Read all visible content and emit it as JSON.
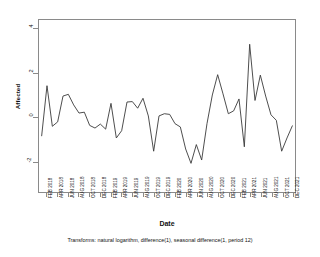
{
  "chart_data": {
    "type": "line",
    "title": "",
    "xlabel": "Date",
    "ylabel": "Affected",
    "ylim": [
      -3.4,
      4.4
    ],
    "yticks": [
      4,
      2,
      0,
      -2
    ],
    "ytick_labels": [
      "4",
      "2",
      "0",
      "-2"
    ],
    "grid": false,
    "legend": null,
    "footnote": "Transforms: natural logarithm, difference(1), seasonal difference(1, period 12)",
    "x": [
      "JAN 2018",
      "FEB 2018",
      "MAR 2018",
      "APR 2018",
      "MAY 2018",
      "JUN 2018",
      "JUL 2018",
      "AUG 2018",
      "SEP 2018",
      "OCT 2018",
      "NOV 2018",
      "DEC 2018",
      "JAN 2019",
      "FEB 2019",
      "MAR 2019",
      "APR 2019",
      "MAY 2019",
      "JUN 2019",
      "JUL 2019",
      "AUG 2019",
      "SEP 2019",
      "OCT 2019",
      "NOV 2019",
      "DEC 2019",
      "JAN 2020",
      "FEB 2020",
      "MAR 2020",
      "APR 2020",
      "MAY 2020",
      "JUN 2020",
      "JUL 2020",
      "AUG 2020",
      "SEP 2020",
      "OCT 2020",
      "NOV 2020",
      "DEC 2020",
      "JAN 2021",
      "FEB 2021",
      "MAR 2021",
      "APR 2021",
      "MAY 2021",
      "JUN 2021",
      "JUL 2021",
      "AUG 2021",
      "SEP 2021",
      "OCT 2021",
      "NOV 2021",
      "DEC 2021"
    ],
    "xtick_labels": [
      "FEB 2018",
      "APR 2018",
      "JUN 2018",
      "AUG 2018",
      "OCT 2018",
      "DEC 2018",
      "FEB 2019",
      "APR 2019",
      "JUN 2019",
      "AUG 2019",
      "OCT 2019",
      "DEC 2019",
      "FEB 2020",
      "APR 2020",
      "JUN 2020",
      "AUG 2020",
      "OCT 2020",
      "DEC 2020",
      "FEB 2021",
      "APR 2021",
      "JUN 2021",
      "AUG 2021",
      "OCT 2021",
      "DEC 2021"
    ],
    "xtick_indices": [
      1,
      3,
      5,
      7,
      9,
      11,
      13,
      15,
      17,
      19,
      21,
      23,
      25,
      27,
      29,
      31,
      33,
      35,
      37,
      39,
      41,
      43,
      45,
      47
    ],
    "values": [
      -0.85,
      1.42,
      -0.42,
      -0.22,
      0.95,
      1.03,
      0.55,
      0.18,
      0.22,
      -0.38,
      -0.5,
      -0.32,
      -0.55,
      0.62,
      -0.95,
      -0.62,
      0.68,
      0.7,
      0.4,
      0.85,
      0.05,
      -1.55,
      0.05,
      0.15,
      0.12,
      -0.3,
      -0.45,
      -1.45,
      -2.1,
      -1.25,
      -1.95,
      -0.3,
      1.0,
      1.92,
      1.05,
      0.15,
      0.28,
      0.82,
      -1.35,
      3.3,
      0.75,
      1.9,
      0.95,
      0.1,
      -0.15,
      -1.55,
      -0.95,
      -0.4
    ],
    "series_color": "#3a3a3a",
    "frame_color": "#8a8a8a"
  },
  "axis": {
    "y_title": "Affected",
    "x_title": "Date"
  },
  "footer": {
    "transforms_note": "Transforms: natural logarithm, difference(1), seasonal difference(1, period 12)"
  }
}
